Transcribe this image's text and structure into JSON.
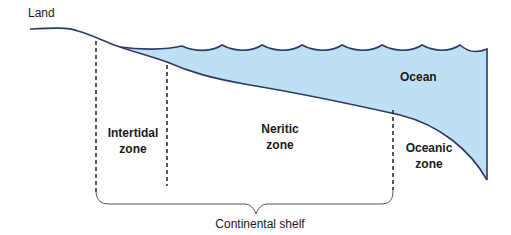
{
  "labels": {
    "land": "Land",
    "ocean": "Ocean",
    "intertidal_line1": "Intertidal",
    "intertidal_line2": "zone",
    "neritic_line1": "Neritic",
    "neritic_line2": "zone",
    "oceanic_line1": "Oceanic",
    "oceanic_line2": "zone",
    "continental_shelf": "Continental shelf"
  },
  "colors": {
    "water_fill": "#bfe0f4",
    "outline": "#2b3a66",
    "dashed": "#222222",
    "brace": "#555555",
    "text": "#1a1a1a"
  }
}
